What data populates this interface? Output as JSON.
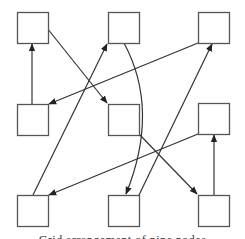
{
  "diagram": {
    "style": {
      "node_stroke": "#555555",
      "edge_stroke": "#333333",
      "background": "#ffffff"
    },
    "nodes": [
      {
        "id": "n1",
        "row": 1,
        "col": 1,
        "x": 17,
        "y": 12,
        "w": 31,
        "h": 31
      },
      {
        "id": "n2",
        "row": 1,
        "col": 2,
        "x": 108,
        "y": 12,
        "w": 31,
        "h": 31
      },
      {
        "id": "n3",
        "row": 1,
        "col": 3,
        "x": 198,
        "y": 12,
        "w": 31,
        "h": 31
      },
      {
        "id": "n4",
        "row": 2,
        "col": 1,
        "x": 17,
        "y": 104,
        "w": 31,
        "h": 31
      },
      {
        "id": "n5",
        "row": 2,
        "col": 2,
        "x": 108,
        "y": 104,
        "w": 31,
        "h": 31
      },
      {
        "id": "n6",
        "row": 2,
        "col": 3,
        "x": 198,
        "y": 103,
        "w": 31,
        "h": 31
      },
      {
        "id": "n7",
        "row": 3,
        "col": 1,
        "x": 17,
        "y": 195,
        "w": 31,
        "h": 31
      },
      {
        "id": "n8",
        "row": 3,
        "col": 2,
        "x": 108,
        "y": 195,
        "w": 31,
        "h": 31
      },
      {
        "id": "n9",
        "row": 3,
        "col": 3,
        "x": 198,
        "y": 195,
        "w": 31,
        "h": 31
      }
    ],
    "edges": [
      {
        "from": "n4",
        "to": "n1",
        "path": "M32,104 L32,44"
      },
      {
        "from": "n1",
        "to": "n5",
        "path": "M47,28 L107,103"
      },
      {
        "from": "n7",
        "to": "n2",
        "path": "M33,195 L107,44"
      },
      {
        "from": "n3",
        "to": "n4",
        "path": "M198,43 L49,104"
      },
      {
        "from": "n2",
        "to": "n8",
        "path": "M124,43 Q160,110 126,194"
      },
      {
        "from": "n8",
        "to": "n3",
        "path": "M139,195 L212,44"
      },
      {
        "from": "n5",
        "to": "n9",
        "path": "M139,134 L197,194"
      },
      {
        "from": "n6",
        "to": "n7",
        "path": "M198,134 L49,195"
      },
      {
        "from": "n9",
        "to": "n6",
        "path": "M214,195 L214,135"
      }
    ]
  },
  "caption": {
    "text": "Grid arrangement of nine nodes"
  }
}
